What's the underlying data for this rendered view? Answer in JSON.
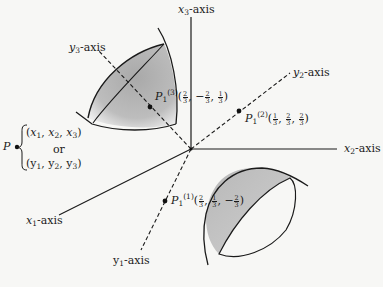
{
  "diagram": {
    "type": "3D coordinate axes with rotated axes and shaded surface patches",
    "origin": [
      191,
      149
    ],
    "axes": {
      "x1": {
        "label_var": "x",
        "label_sub": "1",
        "label_suffix": "-axis",
        "style": "solid"
      },
      "x2": {
        "label_var": "x",
        "label_sub": "2",
        "label_suffix": "-axis",
        "style": "solid"
      },
      "x3": {
        "label_var": "x",
        "label_sub": "3",
        "label_suffix": "-axis",
        "style": "solid"
      },
      "y1": {
        "label_var": "y",
        "label_sub": "1",
        "label_suffix": "-axis",
        "style": "dashed"
      },
      "y2": {
        "label_var": "y",
        "label_sub": "2",
        "label_suffix": "-axis",
        "style": "dashed"
      },
      "y3": {
        "label_var": "y",
        "label_sub": "3",
        "label_suffix": "-axis",
        "style": "dashed"
      }
    },
    "points": {
      "p3": {
        "name": "P",
        "sub": "1",
        "sup": "(3)",
        "coords": [
          {
            "n": "2",
            "d": "3",
            "neg": false
          },
          {
            "n": "2",
            "d": "3",
            "neg": true
          },
          {
            "n": "1",
            "d": "3",
            "neg": false
          }
        ]
      },
      "p2": {
        "name": "P",
        "sub": "1",
        "sup": "(2)",
        "coords": [
          {
            "n": "1",
            "d": "3",
            "neg": false
          },
          {
            "n": "2",
            "d": "3",
            "neg": false
          },
          {
            "n": "2",
            "d": "3",
            "neg": false
          }
        ]
      },
      "p1": {
        "name": "P",
        "sub": "1",
        "sup": "(1)",
        "coords": [
          {
            "n": "2",
            "d": "3",
            "neg": false
          },
          {
            "n": "1",
            "d": "3",
            "neg": false
          },
          {
            "n": "2",
            "d": "3",
            "neg": true
          }
        ]
      }
    },
    "point_P": {
      "name": "P",
      "line1": {
        "open": "(",
        "vars": [
          "x",
          "x",
          "x"
        ],
        "subs": [
          "1",
          "2",
          "3"
        ],
        "close": ")"
      },
      "or": "or",
      "line2": {
        "open": "(",
        "vars": [
          "y",
          "y",
          "y"
        ],
        "subs": [
          "1",
          "2",
          "3"
        ],
        "close": ")"
      }
    },
    "comma": ",",
    "minus": "−",
    "lparen": "(",
    "rparen": ")",
    "colors": {
      "line": "#1a1a1a",
      "shade": "#b5b5b5",
      "background": "#f7f7f5"
    }
  }
}
